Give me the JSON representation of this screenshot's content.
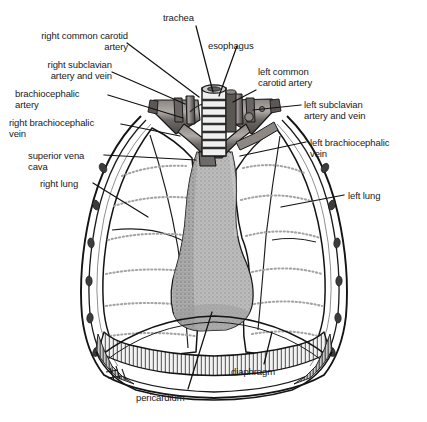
{
  "figure": {
    "style": "black-and-white medical line illustration with stipple shading"
  },
  "colors": {
    "background": "#ffffff",
    "ink": "#1a1a1a",
    "outline": "#111111",
    "lung_fill": "#ffffff",
    "pericardium_gray": "#b5b5b5",
    "pericardium_gray_dark": "#9a9a9a",
    "vessel_gray": "#6e6a68",
    "vessel_gray_dark": "#4a4644",
    "vessel_highlight": "#a9a3a0",
    "trachea_light": "#efefef",
    "trachea_ring": "#3a3a3a",
    "rib_stipple": "#9b9b9b",
    "diaphragm_hatch": "#5d5d5d",
    "leader_line": "#111111"
  },
  "labels": [
    {
      "id": "trachea",
      "text": "trachea",
      "side": "top",
      "align": "left",
      "x": 163,
      "y": 12,
      "leader": {
        "x1": 196,
        "y1": 26,
        "x2": 213,
        "y2": 92
      }
    },
    {
      "id": "esophagus",
      "text": "esophagus",
      "side": "top-right",
      "align": "left",
      "x": 208,
      "y": 40,
      "leader": {
        "x1": 237,
        "y1": 46,
        "x2": 219,
        "y2": 96
      }
    },
    {
      "id": "right-common-carotid-artery",
      "text": "right common carotid\nartery",
      "side": "left",
      "align": "right",
      "x": 24,
      "y": 30,
      "leader": {
        "x1": 127,
        "y1": 43,
        "x2": 199,
        "y2": 97
      }
    },
    {
      "id": "right-subclavian-artery-and-vein",
      "text": "right subclavian\nartery and vein",
      "side": "left",
      "align": "right",
      "x": 24,
      "y": 59,
      "leader": {
        "x1": 112,
        "y1": 72,
        "x2": 185,
        "y2": 104
      }
    },
    {
      "id": "brachiocephalic-artery",
      "text": "brachiocephalic\nartery",
      "side": "left",
      "align": "left",
      "x": 15,
      "y": 88,
      "leader": {
        "x1": 108,
        "y1": 95,
        "x2": 183,
        "y2": 118
      }
    },
    {
      "id": "right-brachiocephalic-vein",
      "text": "right brachiocephalic\nvein",
      "side": "left",
      "align": "left",
      "x": 9,
      "y": 117,
      "leader": {
        "x1": 121,
        "y1": 124,
        "x2": 180,
        "y2": 136
      }
    },
    {
      "id": "superior-vena-cava",
      "text": "superior vena\ncava",
      "side": "left",
      "align": "left",
      "x": 28,
      "y": 150,
      "leader": {
        "x1": 104,
        "y1": 155,
        "x2": 196,
        "y2": 160
      }
    },
    {
      "id": "right-lung",
      "text": "right lung",
      "side": "left",
      "align": "left",
      "x": 40,
      "y": 178,
      "leader": {
        "x1": 93,
        "y1": 183,
        "x2": 148,
        "y2": 217
      }
    },
    {
      "id": "left-common-carotid-artery",
      "text": "left common\ncarotid artery",
      "side": "right",
      "align": "left",
      "x": 258,
      "y": 66,
      "leader": {
        "x1": 256,
        "y1": 90,
        "x2": 233,
        "y2": 102
      }
    },
    {
      "id": "left-subclavian-artery-and-vein",
      "text": "left subclavian\nartery and vein",
      "side": "right",
      "align": "left",
      "x": 304,
      "y": 99,
      "leader": {
        "x1": 301,
        "y1": 105,
        "x2": 253,
        "y2": 110
      }
    },
    {
      "id": "left-brachiocephalic-vein",
      "text": "left brachiocephalic\nvein",
      "side": "right",
      "align": "left",
      "x": 310,
      "y": 137,
      "leader": {
        "x1": 306,
        "y1": 142,
        "x2": 240,
        "y2": 156
      }
    },
    {
      "id": "left-lung",
      "text": "left lung",
      "side": "right",
      "align": "left",
      "x": 348,
      "y": 190,
      "leader": {
        "x1": 344,
        "y1": 195,
        "x2": 281,
        "y2": 207
      }
    },
    {
      "id": "diaphragm",
      "text": "diaphragm",
      "side": "bottom-right",
      "align": "left",
      "x": 231,
      "y": 366,
      "leader": {
        "x1": 264,
        "y1": 364,
        "x2": 272,
        "y2": 332
      }
    },
    {
      "id": "pericardium",
      "text": "pericardium",
      "side": "bottom",
      "align": "left",
      "x": 136,
      "y": 392,
      "leader": {
        "x1": 188,
        "y1": 389,
        "x2": 212,
        "y2": 312
      }
    }
  ],
  "structures": [
    {
      "id": "trachea",
      "name": "trachea",
      "note": "vertical tube with cartilage rings, center top"
    },
    {
      "id": "esophagus",
      "name": "esophagus",
      "note": "behind trachea, right of midline"
    },
    {
      "id": "right-lung",
      "name": "right lung",
      "note": "left of image, three lobes with fissures"
    },
    {
      "id": "left-lung",
      "name": "left lung",
      "note": "right of image, two lobes with fissure"
    },
    {
      "id": "pericardium",
      "name": "pericardium",
      "note": "gray stippled central mediastinal shape"
    },
    {
      "id": "diaphragm",
      "name": "diaphragm",
      "note": "domed hatched band at base of thorax"
    },
    {
      "id": "rib-cage",
      "name": "rib cage",
      "note": "double-line thoracic wall with intercostal nodules"
    },
    {
      "id": "great-vessels",
      "name": "great vessels",
      "note": "branching dark gray arteries and veins at thoracic inlet"
    }
  ]
}
